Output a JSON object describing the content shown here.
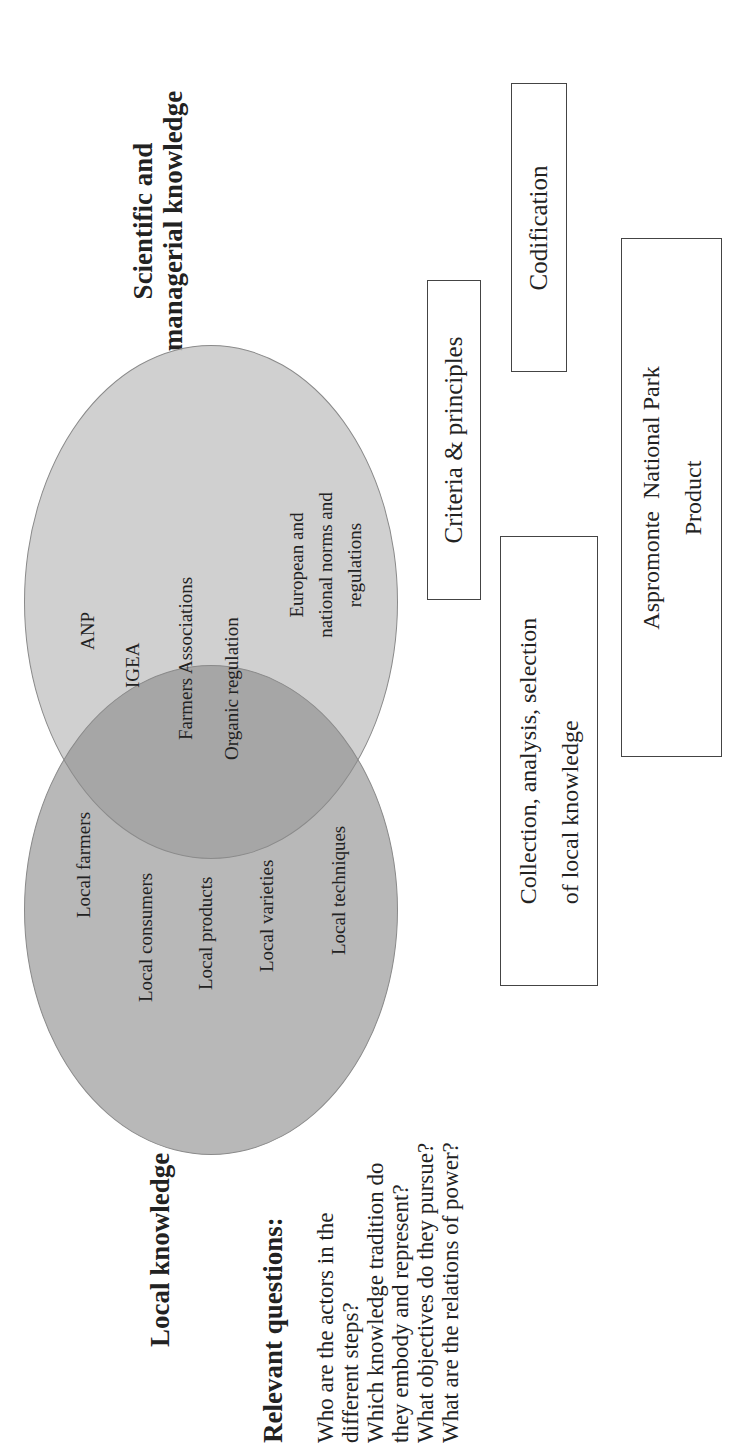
{
  "headings": {
    "scientific_line1": "Scientific and",
    "scientific_line2": "managerial knowledge",
    "local": "Local knowledge",
    "relevant": "Relevant questions:"
  },
  "questions": [
    "Who are the actors in the",
    "different steps?",
    "Which knowledge tradition  do",
    "they embody and represent?",
    "What objectives do they pursue?",
    "What are the relations of power?"
  ],
  "venn": {
    "scientific_items": [
      "ANP",
      "IGEA",
      "Farmers Associations",
      "Organic regulation",
      "European and",
      "national norms and",
      "regulations"
    ],
    "local_items": [
      "Local farmers",
      "Local consumers",
      "Local products",
      "Local varieties",
      "Local techniques"
    ],
    "colors": {
      "scientific_fill": "#d2d2d2",
      "local_fill": "#a8a8a8"
    }
  },
  "boxes": {
    "criteria": "Criteria & principles",
    "codification": "Codification",
    "collection_line1": "Collection, analysis, selection",
    "collection_line2": "of local knowledge",
    "aspromonte_line1": "Aspromonte  National Park",
    "aspromonte_line2": "Product"
  }
}
